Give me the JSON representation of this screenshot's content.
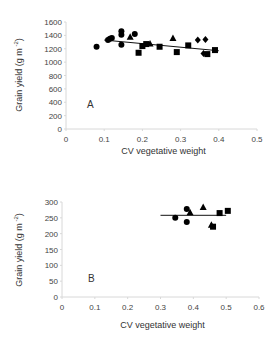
{
  "chart_data": [
    {
      "type": "scatter",
      "panel_label": "A",
      "xlabel": "CV vegetative weight",
      "ylabel": "Grain yield (g m-2)",
      "ylabel_parts": {
        "main": "Grain yield (g m",
        "sup": "-2",
        "end": ")"
      },
      "xlim": [
        0,
        0.5
      ],
      "ylim": [
        0,
        1600
      ],
      "xticks": [
        "0",
        "0.1",
        "0.2",
        "0.3",
        "0.4",
        "0.5"
      ],
      "yticks": [
        "0",
        "200",
        "400",
        "600",
        "800",
        "1000",
        "1200",
        "1400",
        "1600"
      ],
      "grid": false,
      "series": [
        {
          "name": "circle",
          "marker": "circle",
          "points": [
            [
              0.08,
              1230
            ],
            [
              0.11,
              1330
            ],
            [
              0.115,
              1350
            ],
            [
              0.12,
              1360
            ],
            [
              0.145,
              1460
            ],
            [
              0.145,
              1410
            ],
            [
              0.145,
              1260
            ],
            [
              0.18,
              1420
            ]
          ]
        },
        {
          "name": "triangle",
          "marker": "triangle",
          "points": [
            [
              0.168,
              1380
            ],
            [
              0.22,
              1280
            ],
            [
              0.28,
              1360
            ]
          ]
        },
        {
          "name": "square",
          "marker": "square",
          "points": [
            [
              0.19,
              1140
            ],
            [
              0.2,
              1240
            ],
            [
              0.21,
              1270
            ],
            [
              0.245,
              1230
            ],
            [
              0.29,
              1150
            ],
            [
              0.32,
              1250
            ],
            [
              0.37,
              1120
            ],
            [
              0.39,
              1180
            ]
          ]
        },
        {
          "name": "diamond",
          "marker": "diamond",
          "points": [
            [
              0.345,
              1330
            ],
            [
              0.365,
              1340
            ],
            [
              0.36,
              1130
            ]
          ]
        }
      ],
      "trendline": {
        "x": [
          0.1,
          0.4
        ],
        "y": [
          1330,
          1170
        ]
      }
    },
    {
      "type": "scatter",
      "panel_label": "B",
      "xlabel": "CV vegetative weight",
      "ylabel": "Grain yield (g m-2)",
      "ylabel_parts": {
        "main": "Grain yield (g m",
        "sup": "-2",
        "end": ")"
      },
      "xlim": [
        0,
        0.6
      ],
      "ylim": [
        0,
        300
      ],
      "xticks": [
        "0",
        "0.1",
        "0.2",
        "0.3",
        "0.4",
        "0.5",
        "0.6"
      ],
      "yticks": [
        "0",
        "50",
        "100",
        "150",
        "200",
        "250",
        "300"
      ],
      "grid": false,
      "series": [
        {
          "name": "circle",
          "marker": "circle",
          "points": [
            [
              0.345,
              250
            ],
            [
              0.38,
              278
            ],
            [
              0.38,
              237
            ]
          ]
        },
        {
          "name": "triangle",
          "marker": "triangle",
          "points": [
            [
              0.39,
              268
            ],
            [
              0.43,
              284
            ],
            [
              0.455,
              228
            ]
          ]
        },
        {
          "name": "square",
          "marker": "square",
          "points": [
            [
              0.46,
              222
            ],
            [
              0.48,
              265
            ],
            [
              0.505,
              272
            ]
          ]
        }
      ],
      "trendline": {
        "x": [
          0.3,
          0.5
        ],
        "y": [
          258,
          258
        ]
      }
    }
  ]
}
